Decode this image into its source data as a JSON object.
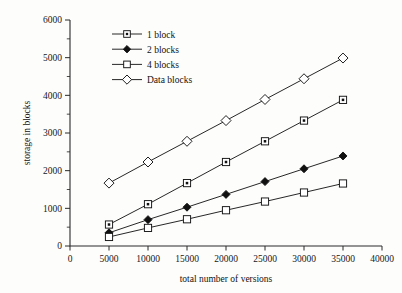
{
  "chart_data": {
    "type": "line",
    "title": "",
    "subtitle": "",
    "xlabel": "total number of versions",
    "ylabel": "storage in blocks",
    "x": [
      5000,
      10000,
      15000,
      20000,
      25000,
      30000,
      35000
    ],
    "xlim": [
      0,
      40000
    ],
    "ylim": [
      0,
      6000
    ],
    "xticks": [
      0,
      5000,
      10000,
      15000,
      20000,
      25000,
      30000,
      35000,
      40000
    ],
    "xtick_labels": [
      "0",
      "5000",
      "10000",
      "15000",
      "20000",
      "25000",
      "30000",
      "35000",
      "40000"
    ],
    "yticks": [
      0,
      1000,
      2000,
      3000,
      4000,
      5000,
      6000
    ],
    "ytick_labels": [
      "0",
      "1000",
      "2000",
      "3000",
      "4000",
      "5000",
      "6000"
    ],
    "y_minor_ticks": [
      500,
      1500,
      2500,
      3500,
      4500,
      5500
    ],
    "grid": false,
    "legend_position": "upper-left-inside",
    "axes_style": "left-and-bottom-spines-only",
    "series": [
      {
        "name": "1 block",
        "marker": "square-with-center-dot",
        "marker_fill": "#ffffff",
        "line_color": "#1b1b1b",
        "values": [
          570,
          1110,
          1670,
          2230,
          2780,
          3330,
          3880
        ]
      },
      {
        "name": "2 blocks",
        "marker": "filled-diamond",
        "marker_fill": "#101010",
        "line_color": "#1b1b1b",
        "values": [
          350,
          700,
          1030,
          1370,
          1710,
          2050,
          2390
        ]
      },
      {
        "name": "4 blocks",
        "marker": "open-square",
        "marker_fill": "#ffffff",
        "line_color": "#1b1b1b",
        "values": [
          240,
          480,
          710,
          950,
          1180,
          1420,
          1660
        ]
      },
      {
        "name": "Data blocks",
        "marker": "open-diamond",
        "marker_fill": "#ffffff",
        "line_color": "#1b1b1b",
        "values": [
          1670,
          2230,
          2780,
          3330,
          3890,
          4440,
          4990
        ]
      }
    ]
  },
  "legend": {
    "entries": [
      {
        "label": "1 block"
      },
      {
        "label": "2 blocks"
      },
      {
        "label": "4 blocks"
      },
      {
        "label": "Data blocks"
      }
    ]
  },
  "colors": {
    "ink": "#1b1b1b",
    "paper": "#fdfdfc",
    "marker_fill": "#ffffff"
  }
}
